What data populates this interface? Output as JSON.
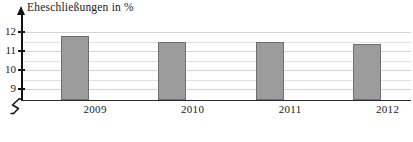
{
  "chart_data": {
    "type": "bar",
    "title": "Eheschließungen in %",
    "xlabel": "",
    "ylabel": "Eheschließungen in %",
    "categories": [
      "2009",
      "2010",
      "2011",
      "2012"
    ],
    "values": [
      11.8,
      11.5,
      11.5,
      11.35
    ],
    "ylim": [
      8.6,
      12.35
    ],
    "y_ticks": [
      "12",
      "11",
      "10",
      "9"
    ],
    "y_tick_values": [
      12,
      11,
      10,
      9
    ],
    "grid": true,
    "grid_orientation": "horizontal",
    "legend": "none",
    "axis_break": true,
    "axis_break_symbol": "zigzag",
    "bar_color": "#9c9c9c",
    "bar_border_color": "#6f6f6f",
    "gridline_color": "#e2e2e2",
    "axis_color": "#131313",
    "background_color": "#ffffff"
  },
  "axes": {
    "y_axis_name": "y-axis",
    "x_axis_name": "x-axis",
    "arrow_direction": "up"
  }
}
